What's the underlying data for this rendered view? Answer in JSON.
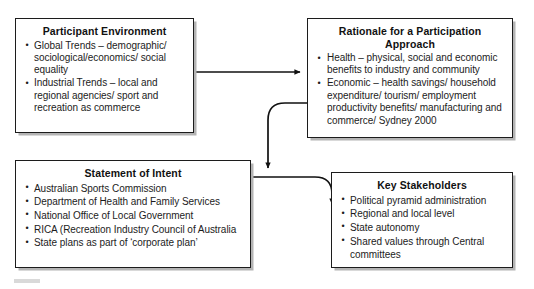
{
  "diagram": {
    "type": "flow-diagram",
    "title": "",
    "nodes": [
      {
        "id": "participant-environment",
        "title": "Participant Environment",
        "items": [
          "Global Trends – demographic/ sociological/economics/ social equality",
          "Industrial Trends – local and regional agencies/ sport and recreation as commerce"
        ]
      },
      {
        "id": "rationale",
        "title": "Rationale for a Participation Approach",
        "items": [
          "Health – physical, social and economic benefits to industry and community",
          "Economic – health savings/ household expenditure/ tourism/ employment productivity benefits/ manufacturing and commerce/ Sydney 2000"
        ]
      },
      {
        "id": "statement-of-intent",
        "title": "Statement of Intent",
        "items": [
          "Australian Sports Commission",
          "Department of Health and Family Services",
          "National Office of Local Government",
          "RICA (Recreation Industry Council of Australia",
          "State plans as part of ‘corporate plan’"
        ]
      },
      {
        "id": "key-stakeholders",
        "title": "Key Stakeholders",
        "items": [
          "Political pyramid administration",
          "Regional and local level",
          "State autonomy",
          "Shared values through Central committees"
        ]
      }
    ],
    "connectors": [
      {
        "id": "participant-environment-to-rationale",
        "from": "participant-environment",
        "to": "rationale",
        "style": "straight-horizontal-arrow"
      },
      {
        "id": "rationale-to-statement-of-intent",
        "from": "rationale",
        "to": "statement-of-intent",
        "style": "elbow-left-down-arrow"
      },
      {
        "id": "statement-of-intent-to-key-stakeholders",
        "from": "statement-of-intent",
        "to": "key-stakeholders",
        "style": "elbow-right-down-arrow"
      }
    ],
    "colors": {
      "node_border": "#1c1c1c",
      "node_fill": "#ffffff",
      "node_shadow": "#b4b4b4",
      "connector": "#111111",
      "text": "#1c1c1c",
      "background": "#ffffff"
    }
  }
}
